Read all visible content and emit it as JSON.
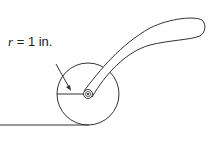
{
  "diagram": {
    "label": {
      "variable": "r",
      "text": " = 1 in."
    },
    "colors": {
      "stroke": "#333333",
      "background": "#ffffff"
    }
  }
}
